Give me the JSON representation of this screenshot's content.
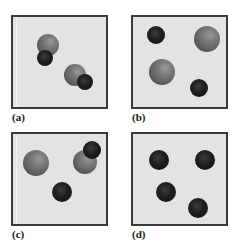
{
  "figure": {
    "colors": {
      "background": "#ffffff",
      "panel_fill": "#e3e3e3",
      "panel_border": "#3a3a3a",
      "grey_sphere": "#6e6e6e",
      "dark_sphere": "#141414"
    },
    "panels": [
      {
        "label": "(a)",
        "box": {
          "left": 11,
          "top": 15,
          "width": 97,
          "height": 94
        },
        "label_pos": {
          "left": 12,
          "top": 112
        },
        "artifact_x": 3,
        "spheres": [
          {
            "type": "grey",
            "cx": 48,
            "cy": 45,
            "r": 11
          },
          {
            "type": "dark",
            "cx": 45,
            "cy": 58,
            "r": 8
          },
          {
            "type": "grey",
            "cx": 75,
            "cy": 75,
            "r": 11
          },
          {
            "type": "dark",
            "cx": 85,
            "cy": 82,
            "r": 8
          }
        ]
      },
      {
        "label": "(b)",
        "box": {
          "left": 131,
          "top": 15,
          "width": 97,
          "height": 94
        },
        "label_pos": {
          "left": 132,
          "top": 112
        },
        "artifact_x": null,
        "spheres": [
          {
            "type": "dark",
            "cx": 156,
            "cy": 35,
            "r": 9
          },
          {
            "type": "grey",
            "cx": 207,
            "cy": 39,
            "r": 13
          },
          {
            "type": "grey",
            "cx": 162,
            "cy": 72,
            "r": 13
          },
          {
            "type": "dark",
            "cx": 199,
            "cy": 88,
            "r": 9
          }
        ]
      },
      {
        "label": "(c)",
        "box": {
          "left": 11,
          "top": 132,
          "width": 97,
          "height": 94
        },
        "label_pos": {
          "left": 12,
          "top": 229
        },
        "artifact_x": 3,
        "spheres": [
          {
            "type": "grey",
            "cx": 36,
            "cy": 163,
            "r": 13
          },
          {
            "type": "grey",
            "cx": 85,
            "cy": 162,
            "r": 12
          },
          {
            "type": "dark",
            "cx": 92,
            "cy": 150,
            "r": 9
          },
          {
            "type": "dark",
            "cx": 62,
            "cy": 192,
            "r": 10
          }
        ]
      },
      {
        "label": "(d)",
        "box": {
          "left": 131,
          "top": 132,
          "width": 97,
          "height": 94
        },
        "label_pos": {
          "left": 132,
          "top": 229
        },
        "artifact_x": null,
        "spheres": [
          {
            "type": "dark",
            "cx": 159,
            "cy": 160,
            "r": 10
          },
          {
            "type": "dark",
            "cx": 205,
            "cy": 160,
            "r": 10
          },
          {
            "type": "dark",
            "cx": 166,
            "cy": 192,
            "r": 10
          },
          {
            "type": "dark",
            "cx": 198,
            "cy": 208,
            "r": 10
          }
        ]
      }
    ]
  }
}
